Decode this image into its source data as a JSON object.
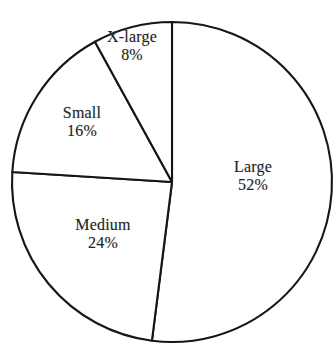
{
  "figure": {
    "name": "pie-chart-figure",
    "background_color": "#ffffff",
    "line_color": "#161616",
    "slice_fill": "#ffffff",
    "title_partial": ""
  },
  "chart_data": {
    "type": "pie",
    "title": "",
    "xlabel": "",
    "ylabel": "",
    "legend": "none",
    "grid": false,
    "label_position": "inside-slices",
    "label_format": "name + percent",
    "start_angle_deg": 0,
    "direction": "clockwise",
    "categories": [
      "Large",
      "Medium",
      "Small",
      "X-large"
    ],
    "values": [
      52,
      24,
      16,
      8
    ],
    "units": "percent",
    "total": 100,
    "slices": [
      {
        "name": "Large",
        "label": "Large",
        "value": 52,
        "value_text": "52%",
        "start_deg": 0,
        "end_deg": 187.2,
        "fill": "#ffffff",
        "stroke": "#161616"
      },
      {
        "name": "Medium",
        "label": "Medium",
        "value": 24,
        "value_text": "24%",
        "start_deg": 187.2,
        "end_deg": 273.6,
        "fill": "#ffffff",
        "stroke": "#161616"
      },
      {
        "name": "Small",
        "label": "Small",
        "value": 16,
        "value_text": "16%",
        "start_deg": 273.6,
        "end_deg": 331.2,
        "fill": "#ffffff",
        "stroke": "#161616"
      },
      {
        "name": "X-large",
        "label": "X-large",
        "value": 8,
        "value_text": "8%",
        "start_deg": 331.2,
        "end_deg": 360,
        "fill": "#ffffff",
        "stroke": "#161616"
      }
    ]
  }
}
